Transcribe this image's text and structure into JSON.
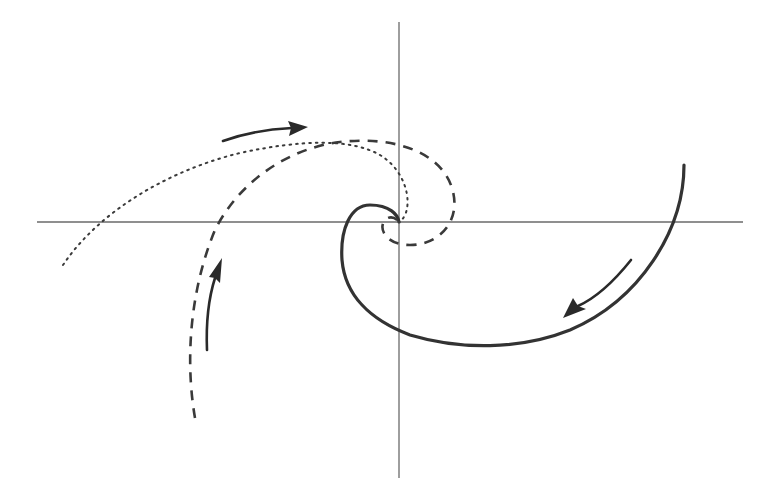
{
  "diagram": {
    "colors": {
      "background": "#ffffff",
      "axis": "#6a6a6a",
      "curve": "#333333",
      "arrow": "#2a2a2a"
    },
    "axes": {
      "origin": [
        399,
        222
      ],
      "x_axis": {
        "from": [
          37,
          222
        ],
        "to": [
          743,
          222
        ]
      },
      "y_axis": {
        "from": [
          399,
          22
        ],
        "to": [
          399,
          478
        ]
      }
    },
    "trajectories": [
      {
        "name": "solid-spiral",
        "style": "solid",
        "start": [
          684,
          165
        ],
        "end": [
          399,
          222
        ],
        "direction": "inward, clockwise"
      },
      {
        "name": "dashed-spiral",
        "style": "dashed",
        "start": [
          195,
          418
        ],
        "end": [
          399,
          222
        ],
        "direction": "inward, clockwise"
      },
      {
        "name": "dotted-spiral",
        "style": "dotted",
        "start": [
          63,
          265
        ],
        "end": [
          399,
          222
        ],
        "direction": "inward, clockwise"
      }
    ],
    "arrows": [
      {
        "name": "arrow-dotted-curve",
        "direction": "right",
        "position": [
          265,
          130
        ]
      },
      {
        "name": "arrow-solid-curve",
        "direction": "down-left",
        "position": [
          600,
          290
        ]
      },
      {
        "name": "arrow-dashed-curve",
        "direction": "up",
        "position": [
          212,
          300
        ]
      }
    ],
    "labels": []
  }
}
